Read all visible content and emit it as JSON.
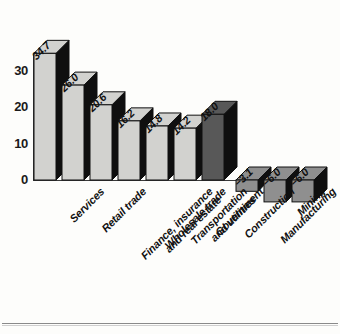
{
  "chart_data": {
    "type": "bar",
    "title": "",
    "subtitle": "",
    "xlabel": "",
    "ylabel": "",
    "ylim": [
      -10,
      40
    ],
    "yticks": [
      0,
      10,
      20,
      30
    ],
    "ytick_labels": [
      "0",
      "10",
      "20",
      "30"
    ],
    "grid": false,
    "legend": "none",
    "orientation": "vertical",
    "style": "3d-bar",
    "categories": [
      "Services",
      "Retail trade",
      "Finance, insurance\nand real estate",
      "Wholesale trade",
      "Transportation\nand utilities",
      "Government",
      "Construction",
      "Manufacturing",
      "Mining",
      "Agriculture, forestry\nand fishing"
    ],
    "values": [
      34.7,
      26.0,
      20.6,
      16.2,
      14.8,
      14.2,
      18.0,
      null,
      -3.1,
      -6.0
    ],
    "data_labels": [
      "34.7",
      "26.0",
      "20.6",
      "16.2",
      "14.8",
      "14.2",
      "18.0",
      "−3.1",
      "−6.0",
      "−6.0"
    ],
    "bars": [
      {
        "label": "Services",
        "value": 34.7,
        "data_label": "34.7",
        "fill": "#d2d2cf",
        "sign": "positive"
      },
      {
        "label": "Retail trade",
        "value": 26.0,
        "data_label": "26.0",
        "fill": "#d2d2cf",
        "sign": "positive"
      },
      {
        "label": "Finance, insurance\nand real estate",
        "value": 20.6,
        "data_label": "20.6",
        "fill": "#d2d2cf",
        "sign": "positive"
      },
      {
        "label": "Wholesale trade",
        "value": 16.2,
        "data_label": "16.2",
        "fill": "#d2d2cf",
        "sign": "positive"
      },
      {
        "label": "Transportation\nand utilities",
        "value": 14.8,
        "data_label": "14.8",
        "fill": "#d2d2cf",
        "sign": "positive"
      },
      {
        "label": "Government",
        "value": 14.2,
        "data_label": "14.2",
        "fill": "#d2d2cf",
        "sign": "positive"
      },
      {
        "label": "Construction",
        "value": 18.0,
        "data_label": "18.0",
        "fill": "#585858",
        "sign": "positive"
      },
      {
        "label": "Manufacturing",
        "value": -3.1,
        "data_label": "−3.1",
        "fill": "#8f8f8f",
        "sign": "negative"
      },
      {
        "label": "Mining",
        "value": -6.0,
        "data_label": "−6.0",
        "fill": "#8f8f8f",
        "sign": "negative"
      },
      {
        "label": "Agriculture, forestry\nand fishing",
        "value": -6.0,
        "data_label": "−6.0",
        "fill": "#8f8f8f",
        "sign": "negative"
      }
    ],
    "colors": {
      "positive_light": "#d2d2cf",
      "positive_dark": "#585858",
      "negative": "#8f8f8f",
      "bar_side": "#0f0f0f",
      "axis": "#3a3a3a",
      "text": "#111111",
      "background": "#fdfdfb"
    }
  }
}
